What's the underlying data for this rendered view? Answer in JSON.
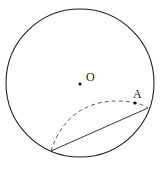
{
  "figure": {
    "labels": {
      "center": "O",
      "point_a": "A"
    },
    "elements": [
      "circle with center O",
      "point A inside circle",
      "chord between two points on circle",
      "dashed arc through near point A (fold of circle)"
    ],
    "colors": {
      "stroke": "#222222",
      "background": "#ffffff"
    }
  }
}
